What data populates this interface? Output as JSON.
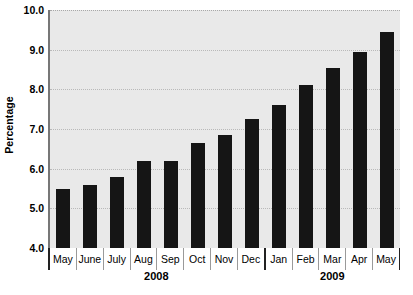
{
  "chart_data": {
    "type": "bar",
    "title": "",
    "xlabel": "",
    "ylabel": "Percentage",
    "ylim": [
      4.0,
      10.0
    ],
    "ytick_step": 1.0,
    "yticks": [
      "10.0",
      "9.0",
      "8.0",
      "7.0",
      "6.0",
      "5.0",
      "4.0"
    ],
    "ytick_values": [
      10.0,
      9.0,
      8.0,
      7.0,
      6.0,
      5.0,
      4.0
    ],
    "grid": true,
    "legend": null,
    "categories": [
      "May",
      "June",
      "July",
      "Aug",
      "Sep",
      "Oct",
      "Nov",
      "Dec",
      "Jan",
      "Feb",
      "Mar",
      "Apr",
      "May"
    ],
    "values": [
      5.5,
      5.6,
      5.8,
      6.2,
      6.2,
      6.65,
      6.85,
      7.25,
      7.6,
      8.1,
      8.55,
      8.95,
      9.45
    ],
    "groups": [
      {
        "label": "2008",
        "start_index": 0,
        "count": 8
      },
      {
        "label": "2009",
        "start_index": 8,
        "count": 5
      }
    ],
    "bar_color": "#151515",
    "plot_background": "#e9e9e9",
    "gridline_color": "#b9b9b9"
  }
}
